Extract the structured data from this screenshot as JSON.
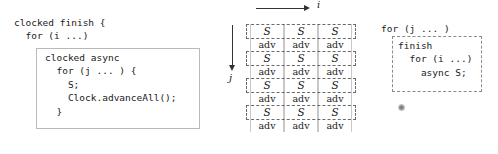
{
  "figure": {
    "width": 498,
    "height": 154,
    "background": "#ffffff",
    "ink_color": "#1a1a1a"
  },
  "left_panel": {
    "outer_code": "clocked finish {\n  for (i ...)",
    "inner_code": "clocked async\n  for (j ... ) {\n    S;\n    Clock.advanceAll();\n  }",
    "box_border_color": "#b9b9b9",
    "box_border_style": "solid"
  },
  "middle_panel": {
    "axes": {
      "i_label": "i",
      "j_label": "j",
      "i_direction": "right",
      "j_direction": "down"
    },
    "grid": {
      "columns": 3,
      "rows": 4,
      "column_border_style": "solid",
      "column_border_color": "#c8c8c8",
      "row_border_style": "dashed",
      "row_border_color": "#6a6a6a",
      "cells": [
        {
          "row": 0,
          "s": "S",
          "adv": [
            "adv",
            "adv",
            "adv"
          ],
          "s_values": [
            "S",
            "S",
            "S"
          ]
        },
        {
          "row": 1,
          "s": "S",
          "adv": [
            "adv",
            "adv",
            "adv"
          ],
          "s_values": [
            "S",
            "S",
            "S"
          ]
        },
        {
          "row": 2,
          "s": "S",
          "adv": [
            "adv",
            "adv",
            "adv"
          ],
          "s_values": [
            "S",
            "S",
            "S"
          ]
        },
        {
          "row": 3,
          "s": "S",
          "adv": [
            "adv",
            "adv",
            "adv"
          ],
          "s_values": [
            "S",
            "S",
            "S"
          ]
        }
      ],
      "s_label": "S",
      "adv_label": "adv"
    }
  },
  "right_panel": {
    "outer_code": "for (j ... )",
    "inner_code": "finish\n  for (i ...)\n    async S;",
    "box_border_color": "#8a8a8a",
    "box_border_style": "dashed"
  }
}
